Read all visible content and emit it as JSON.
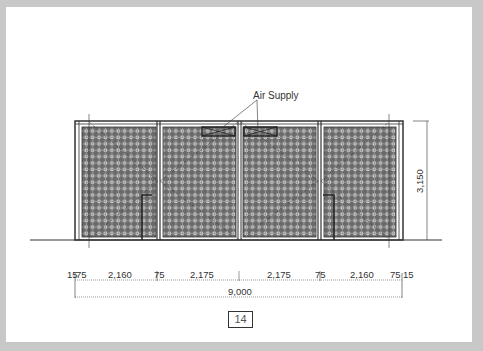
{
  "drawing": {
    "type": "elevation",
    "annotation": "Air Supply",
    "height_dimension": "3,150",
    "overall_width_dimension": "9,000",
    "bottom_dimensions": [
      "15",
      "75",
      "2,160",
      "75",
      "2,175",
      "2,175",
      "75",
      "2,160",
      "75",
      "15"
    ],
    "bottom_dimension_labels": {
      "d0": "15",
      "d1": "75",
      "d2": "2,160",
      "d3": "75",
      "d4": "2,175",
      "d5": "2,175",
      "d6": "75",
      "d7": "2,160",
      "d8": "75",
      "d9": "15"
    },
    "panels": 4,
    "colors": {
      "line": "#333333",
      "grid_dark": "#6e6e6e",
      "grid_light": "#ffffff",
      "background": "#c8c8c8",
      "page": "#ffffff"
    }
  },
  "page": {
    "number": "14"
  }
}
